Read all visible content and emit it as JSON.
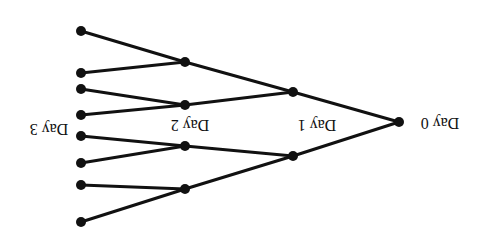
{
  "diagram": {
    "type": "binomial-tree",
    "orientation": "rotated-180",
    "colors": {
      "line": "#111111",
      "background": "#ffffff"
    },
    "labels": [
      {
        "id": "day0",
        "text": "Day 0",
        "x": 440,
        "y": 122
      },
      {
        "id": "day1",
        "text": "Day 1",
        "x": 317,
        "y": 124
      },
      {
        "id": "day2",
        "text": "Day 2",
        "x": 190,
        "y": 124
      },
      {
        "id": "day3",
        "text": "Day 3",
        "x": 49,
        "y": 128
      }
    ],
    "nodes": [
      {
        "id": "d0",
        "x": 399,
        "y": 122
      },
      {
        "id": "d1a",
        "x": 293,
        "y": 92
      },
      {
        "id": "d1b",
        "x": 293,
        "y": 156
      },
      {
        "id": "d2a",
        "x": 185,
        "y": 62
      },
      {
        "id": "d2b",
        "x": 185,
        "y": 105
      },
      {
        "id": "d2c",
        "x": 185,
        "y": 146
      },
      {
        "id": "d2d",
        "x": 185,
        "y": 189
      },
      {
        "id": "d3a",
        "x": 81,
        "y": 31
      },
      {
        "id": "d3b",
        "x": 81,
        "y": 73
      },
      {
        "id": "d3c",
        "x": 81,
        "y": 89
      },
      {
        "id": "d3d",
        "x": 81,
        "y": 115
      },
      {
        "id": "d3e",
        "x": 81,
        "y": 136
      },
      {
        "id": "d3f",
        "x": 81,
        "y": 163
      },
      {
        "id": "d3g",
        "x": 81,
        "y": 185
      },
      {
        "id": "d3h",
        "x": 81,
        "y": 222
      }
    ],
    "edges": [
      [
        "d0",
        "d1a"
      ],
      [
        "d0",
        "d1b"
      ],
      [
        "d1a",
        "d2a"
      ],
      [
        "d1a",
        "d2b"
      ],
      [
        "d1b",
        "d2c"
      ],
      [
        "d1b",
        "d2d"
      ],
      [
        "d2a",
        "d3a"
      ],
      [
        "d2a",
        "d3b"
      ],
      [
        "d2b",
        "d3c"
      ],
      [
        "d2b",
        "d3d"
      ],
      [
        "d2c",
        "d3e"
      ],
      [
        "d2c",
        "d3f"
      ],
      [
        "d2d",
        "d3g"
      ],
      [
        "d2d",
        "d3h"
      ]
    ]
  }
}
